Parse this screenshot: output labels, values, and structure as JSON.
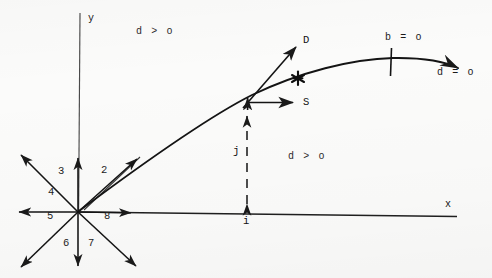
{
  "figure": {
    "kind": "trajectory-diagram",
    "background_color": "#fbfbfa",
    "ink_color": "#1a1a1a",
    "axes": {
      "y_label": "y",
      "x_label": "x",
      "origin": {
        "x": 78,
        "y": 212
      }
    },
    "ray_star": {
      "description": "eight rays radiating from the origin, numbered labels",
      "labels": [
        {
          "id": "2",
          "text": "2",
          "x": 101,
          "y": 165
        },
        {
          "id": "3",
          "text": "3",
          "x": 58,
          "y": 166
        },
        {
          "id": "4",
          "text": "4",
          "x": 48,
          "y": 187
        },
        {
          "id": "5",
          "text": "5",
          "x": 47,
          "y": 211
        },
        {
          "id": "6",
          "text": "6",
          "x": 63,
          "y": 238
        },
        {
          "id": "7",
          "text": "7",
          "x": 88,
          "y": 238
        },
        {
          "id": "8",
          "text": "8",
          "x": 104,
          "y": 211
        }
      ]
    },
    "vectors": [
      {
        "id": "D",
        "text": "D",
        "x": 303,
        "y": 35,
        "note": "arrow from curve pointing up-right"
      },
      {
        "id": "S",
        "text": "S",
        "x": 303,
        "y": 100,
        "note": "horizontal arrow pointing right"
      },
      {
        "id": "j",
        "text": "j",
        "x": 233,
        "y": 146,
        "note": "vertical dashed double-headed arrow"
      },
      {
        "id": "i",
        "text": "i",
        "x": 241,
        "y": 221,
        "note": "foot of dashed arrow on x-axis"
      }
    ],
    "conditions": [
      {
        "id": "d-gt-o-upper",
        "text": "d > o",
        "x": 136,
        "y": 27
      },
      {
        "id": "d-gt-o-lower",
        "text": "d > o",
        "x": 288,
        "y": 152
      },
      {
        "id": "b-eq-o",
        "text": "b = o",
        "x": 385,
        "y": 35
      },
      {
        "id": "d-eq-o",
        "text": "d = o",
        "x": 437,
        "y": 73
      }
    ],
    "markers": [
      {
        "id": "asterisk",
        "glyph": "✱",
        "x": 298,
        "y": 78
      },
      {
        "id": "tick-b",
        "x": 391,
        "y": 62
      }
    ]
  }
}
